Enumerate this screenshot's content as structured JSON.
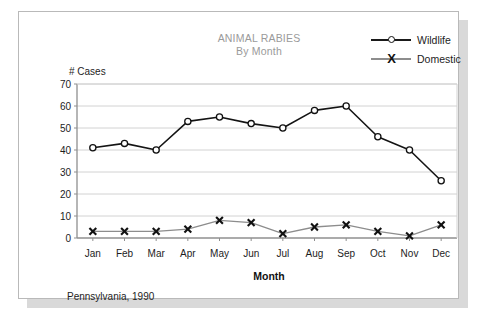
{
  "chart_data": {
    "type": "line",
    "title": "ANIMAL RABIES",
    "subtitle": "By Month",
    "caption": "Pennsylvania, 1990",
    "xlabel": "Month",
    "ylabel": "# Cases",
    "categories": [
      "Jan",
      "Feb",
      "Mar",
      "Apr",
      "May",
      "Jun",
      "Jul",
      "Aug",
      "Sep",
      "Oct",
      "Nov",
      "Dec"
    ],
    "series": [
      {
        "name": "Wildlife",
        "marker": "circle-open",
        "color": "#141414",
        "values": [
          41,
          43,
          40,
          53,
          55,
          52,
          50,
          58,
          60,
          46,
          40,
          26
        ]
      },
      {
        "name": "Domestic",
        "marker": "x-bold",
        "color": "#8d8d8d",
        "values": [
          3,
          3,
          3,
          4,
          8,
          7,
          2,
          5,
          6,
          3,
          1,
          6
        ]
      }
    ],
    "ylim": [
      0,
      70
    ],
    "yticks": [
      0,
      10,
      20,
      30,
      40,
      50,
      60,
      70
    ],
    "grid": true,
    "grid_color": "#d2d2d2",
    "legend_position": "top-right",
    "title_color": "#9a9a9a",
    "axis_color": "#8f8f8f",
    "background": "#ffffff"
  },
  "legend": {
    "items": [
      {
        "label": "Wildlife",
        "marker": "circle-open"
      },
      {
        "label": "Domestic",
        "marker": "x-bold"
      }
    ]
  }
}
